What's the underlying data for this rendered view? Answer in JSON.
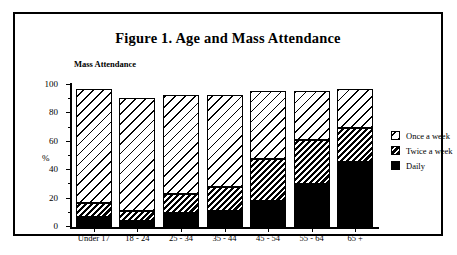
{
  "figure": {
    "title": "Figure 1. Age and Mass Attendance",
    "plot_label": "Mass Attendance",
    "ylabel": "%"
  },
  "legend": {
    "position": "right",
    "items": [
      {
        "label": "Once a week",
        "pattern": "wide-diagonal-hatch",
        "swatch": "once-a-week-swatch"
      },
      {
        "label": "Twice a week",
        "pattern": "dense-diagonal-hatch",
        "swatch": "twice-a-week-swatch"
      },
      {
        "label": "Daily",
        "pattern": "solid-black",
        "swatch": "daily-swatch"
      }
    ]
  },
  "chart_data": {
    "type": "bar",
    "stacked": true,
    "title": "Figure 1. Age and Mass Attendance",
    "subtitle": "Mass Attendance",
    "xlabel": "",
    "ylabel": "%",
    "ylim": [
      0,
      100
    ],
    "yticks": [
      0,
      20,
      40,
      60,
      80,
      100
    ],
    "grid": false,
    "categories": [
      "Under 17",
      "18 - 24",
      "25 - 34",
      "35 - 44",
      "45 - 54",
      "55 - 64",
      "65 +"
    ],
    "series": [
      {
        "name": "Daily",
        "values": [
          7,
          4,
          10,
          11,
          18,
          30,
          46
        ]
      },
      {
        "name": "Twice a week",
        "values": [
          10,
          7,
          13,
          17,
          30,
          31,
          24
        ]
      },
      {
        "name": "Once a week",
        "values": [
          80,
          80,
          70,
          65,
          48,
          35,
          27
        ]
      }
    ],
    "cumulative_tops": {
      "Daily": [
        7,
        4,
        10,
        11,
        18,
        30,
        46
      ],
      "Daily+Twice": [
        17,
        11,
        23,
        28,
        48,
        61,
        70
      ],
      "Total": [
        97,
        91,
        93,
        93,
        96,
        96,
        97
      ]
    }
  }
}
